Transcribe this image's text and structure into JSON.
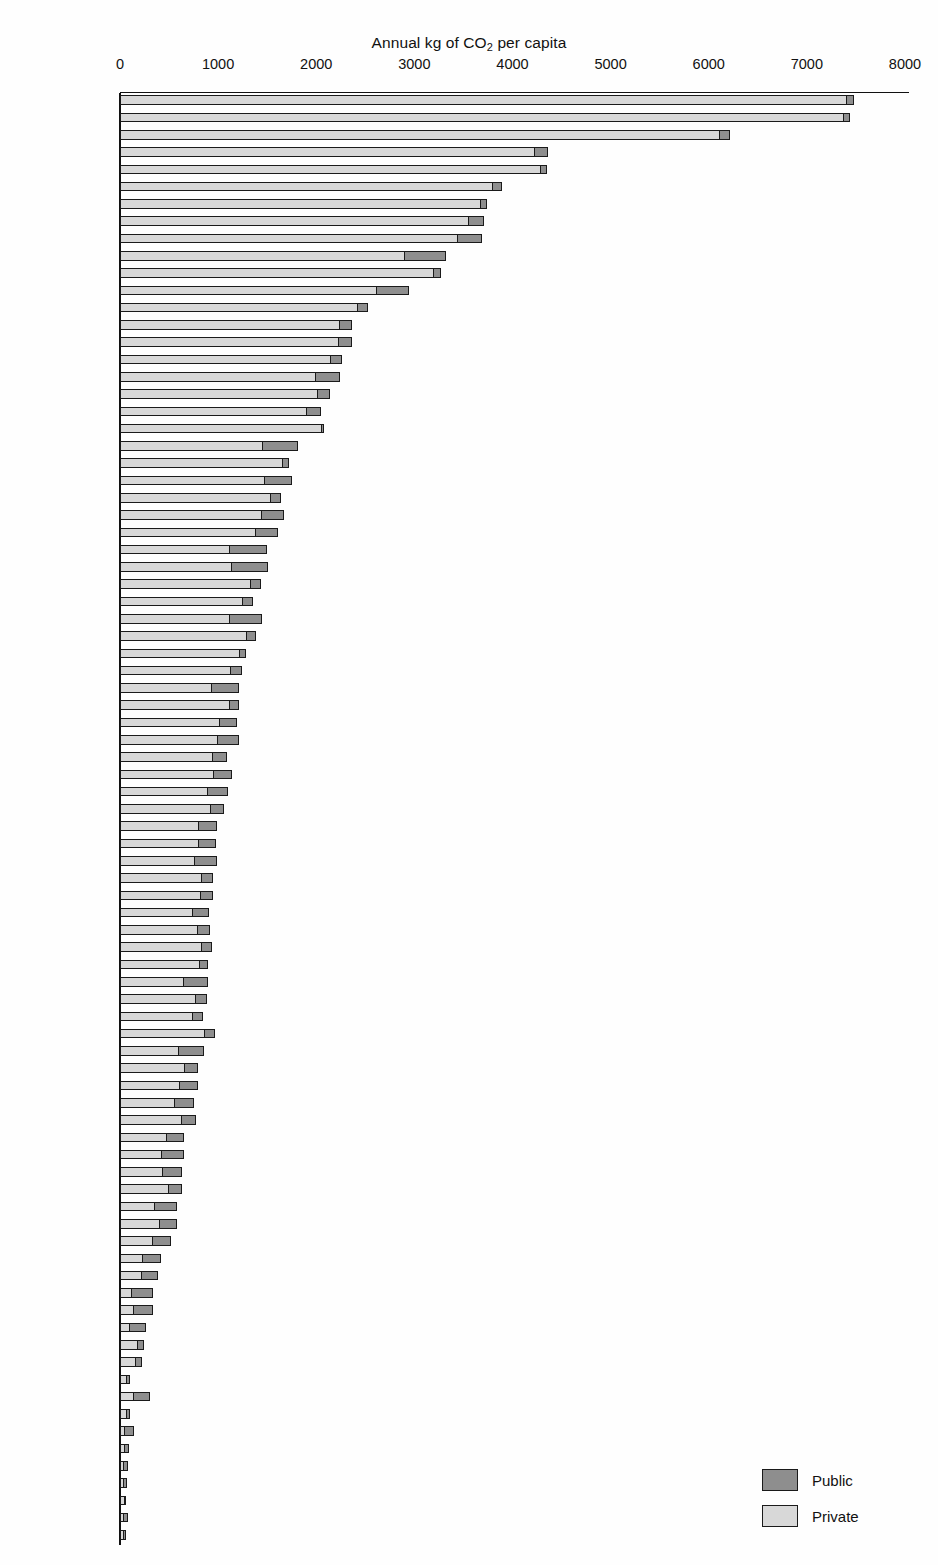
{
  "chart_data": {
    "type": "bar",
    "orientation": "horizontal",
    "stacked": true,
    "title": "Annual kg of CO2 per capita",
    "title_prefix": "Annual kg of CO",
    "title_subscript": "2",
    "title_suffix": " per capita",
    "xlabel": "",
    "ylabel": "",
    "xlim": [
      0,
      8000
    ],
    "xticks": [
      0,
      1000,
      2000,
      3000,
      4000,
      5000,
      6000,
      7000,
      8000
    ],
    "xtick_labels": [
      "0",
      "1000",
      "2000",
      "3000",
      "4000",
      "5000",
      "6000",
      "7000",
      "8000"
    ],
    "grid": false,
    "legend_position": "bottom-right",
    "legend": [
      {
        "name": "Public",
        "color": "#8e8e8e"
      },
      {
        "name": "Private",
        "color": "#d8d8d8"
      }
    ],
    "series": [
      {
        "name": "Private",
        "color": "#d8d8d8"
      },
      {
        "name": "Public",
        "color": "#8e8e8e"
      }
    ],
    "categories": [
      "Atlanta",
      "Houston",
      "San Francisco",
      "Denver",
      "San Diego",
      "Los Angeles",
      "Phoenix",
      "Washington",
      "Chicago",
      "New York",
      "Calgary",
      "Toronto",
      "Melbourne",
      "Perth",
      "Brisbane",
      "Vancouver",
      "Sydney",
      "Ottawa",
      "Montreal",
      "Riyadh",
      "Brussels",
      "Wellington",
      "Frankfurt",
      "Geneva",
      "Rome",
      "Hamburg",
      "Munich",
      "Stuttgart",
      "Oslo",
      "Stockholm",
      "Bangkok",
      "Nantes",
      "Marseille",
      "Ruhr",
      "Glasgow",
      "Lyon",
      "Zurich",
      "Vienna",
      "Dusseldorf",
      "Copenhagen",
      "London",
      "Newcastle",
      "Madrid",
      "Paris",
      "Berlin",
      "Graz",
      "Berne",
      "Milan",
      "Bologna",
      "Tel Aviv",
      "Amsterdam",
      "Johannesburg",
      "Athens",
      "Manchester",
      "Sapporo",
      "Tokyo",
      "Helsinki",
      "Singapore",
      "Osaka",
      "Kuala Lumpur",
      "Prague",
      "Sao Paulo",
      "Seoul",
      "Taipei",
      "Budapest",
      "Curitiba",
      "Barcelona",
      "Cape Town",
      "Harare",
      "Bogota",
      "Cracow",
      "Hong Kong",
      "Tehran",
      "Tunis",
      "Jakarta",
      "Manila",
      "Beijing",
      "Dakar",
      "Guangzhou",
      "Cairo",
      "Chennai",
      "Shanghai",
      "Mumbai",
      "Ho Chi Minh"
    ],
    "rows": [
      {
        "city": "Atlanta",
        "private": 7410,
        "public": 70,
        "total": 7480
      },
      {
        "city": "Houston",
        "private": 7380,
        "public": 60,
        "total": 7440
      },
      {
        "city": "San Francisco",
        "private": 6110,
        "public": 110,
        "total": 6220
      },
      {
        "city": "Denver",
        "private": 4230,
        "public": 130,
        "total": 4360
      },
      {
        "city": "San Diego",
        "private": 4290,
        "public": 60,
        "total": 4350
      },
      {
        "city": "Los Angeles",
        "private": 3800,
        "public": 90,
        "total": 3890
      },
      {
        "city": "Phoenix",
        "private": 3680,
        "public": 60,
        "total": 3740
      },
      {
        "city": "Washington",
        "private": 3560,
        "public": 150,
        "total": 3710
      },
      {
        "city": "Chicago",
        "private": 3440,
        "public": 250,
        "total": 3690
      },
      {
        "city": "New York",
        "private": 2900,
        "public": 420,
        "total": 3320
      },
      {
        "city": "Calgary",
        "private": 3200,
        "public": 70,
        "total": 3270
      },
      {
        "city": "Toronto",
        "private": 2620,
        "public": 330,
        "total": 2950
      },
      {
        "city": "Melbourne",
        "private": 2420,
        "public": 110,
        "total": 2530
      },
      {
        "city": "Perth",
        "private": 2240,
        "public": 120,
        "total": 2360
      },
      {
        "city": "Brisbane",
        "private": 2230,
        "public": 130,
        "total": 2360
      },
      {
        "city": "Vancouver",
        "private": 2150,
        "public": 110,
        "total": 2260
      },
      {
        "city": "Sydney",
        "private": 2000,
        "public": 240,
        "total": 2240
      },
      {
        "city": "Ottawa",
        "private": 2020,
        "public": 120,
        "total": 2140
      },
      {
        "city": "Montreal",
        "private": 1900,
        "public": 150,
        "total": 2050
      },
      {
        "city": "Riyadh",
        "private": 2060,
        "public": 20,
        "total": 2080
      },
      {
        "city": "Brussels",
        "private": 1450,
        "public": 360,
        "total": 1810
      },
      {
        "city": "Wellington",
        "private": 1660,
        "public": 60,
        "total": 1720
      },
      {
        "city": "Frankfurt",
        "private": 1470,
        "public": 280,
        "total": 1750
      },
      {
        "city": "Geneva",
        "private": 1540,
        "public": 100,
        "total": 1640
      },
      {
        "city": "Rome",
        "private": 1440,
        "public": 230,
        "total": 1670
      },
      {
        "city": "Hamburg",
        "private": 1380,
        "public": 230,
        "total": 1610
      },
      {
        "city": "Munich",
        "private": 1120,
        "public": 380,
        "total": 1500
      },
      {
        "city": "Stuttgart",
        "private": 1140,
        "public": 370,
        "total": 1510
      },
      {
        "city": "Oslo",
        "private": 1330,
        "public": 110,
        "total": 1440
      },
      {
        "city": "Stockholm",
        "private": 1250,
        "public": 110,
        "total": 1360
      },
      {
        "city": "Bangkok",
        "private": 1120,
        "public": 330,
        "total": 1450
      },
      {
        "city": "Nantes",
        "private": 1290,
        "public": 100,
        "total": 1390
      },
      {
        "city": "Marseille",
        "private": 1220,
        "public": 60,
        "total": 1280
      },
      {
        "city": "Ruhr",
        "private": 1130,
        "public": 110,
        "total": 1240
      },
      {
        "city": "Glasgow",
        "private": 930,
        "public": 280,
        "total": 1210
      },
      {
        "city": "Lyon",
        "private": 1120,
        "public": 90,
        "total": 1210
      },
      {
        "city": "Zurich",
        "private": 1020,
        "public": 170,
        "total": 1190
      },
      {
        "city": "Vienna",
        "private": 1000,
        "public": 210,
        "total": 1210
      },
      {
        "city": "Dusseldorf",
        "private": 940,
        "public": 150,
        "total": 1090
      },
      {
        "city": "Copenhagen",
        "private": 950,
        "public": 190,
        "total": 1140
      },
      {
        "city": "London",
        "private": 890,
        "public": 210,
        "total": 1100
      },
      {
        "city": "Newcastle",
        "private": 930,
        "public": 130,
        "total": 1060
      },
      {
        "city": "Madrid",
        "private": 800,
        "public": 190,
        "total": 990
      },
      {
        "city": "Paris",
        "private": 800,
        "public": 180,
        "total": 980
      },
      {
        "city": "Berlin",
        "private": 760,
        "public": 230,
        "total": 990
      },
      {
        "city": "Graz",
        "private": 830,
        "public": 120,
        "total": 950
      },
      {
        "city": "Berne",
        "private": 820,
        "public": 130,
        "total": 950
      },
      {
        "city": "Milan",
        "private": 740,
        "public": 170,
        "total": 910
      },
      {
        "city": "Bologna",
        "private": 790,
        "public": 130,
        "total": 920
      },
      {
        "city": "Tel Aviv",
        "private": 830,
        "public": 110,
        "total": 940
      },
      {
        "city": "Amsterdam",
        "private": 810,
        "public": 90,
        "total": 900
      },
      {
        "city": "Johannesburg",
        "private": 650,
        "public": 250,
        "total": 900
      },
      {
        "city": "Athens",
        "private": 770,
        "public": 120,
        "total": 890
      },
      {
        "city": "Manchester",
        "private": 740,
        "public": 110,
        "total": 850
      },
      {
        "city": "Sapporo",
        "private": 860,
        "public": 110,
        "total": 970
      },
      {
        "city": "Tokyo",
        "private": 600,
        "public": 260,
        "total": 860
      },
      {
        "city": "Helsinki",
        "private": 660,
        "public": 130,
        "total": 790
      },
      {
        "city": "Singapore",
        "private": 610,
        "public": 180,
        "total": 790
      },
      {
        "city": "Osaka",
        "private": 560,
        "public": 190,
        "total": 750
      },
      {
        "city": "Kuala Lumpur",
        "private": 630,
        "public": 140,
        "total": 770
      },
      {
        "city": "Prague",
        "private": 470,
        "public": 180,
        "total": 650
      },
      {
        "city": "Sao Paulo",
        "private": 420,
        "public": 230,
        "total": 650
      },
      {
        "city": "Seoul",
        "private": 430,
        "public": 200,
        "total": 630
      },
      {
        "city": "Taipei",
        "private": 500,
        "public": 130,
        "total": 630
      },
      {
        "city": "Budapest",
        "private": 350,
        "public": 230,
        "total": 580
      },
      {
        "city": "Curitiba",
        "private": 400,
        "public": 180,
        "total": 580
      },
      {
        "city": "Barcelona",
        "private": 330,
        "public": 190,
        "total": 520
      },
      {
        "city": "Cape Town",
        "private": 230,
        "public": 190,
        "total": 420
      },
      {
        "city": "Harare",
        "private": 220,
        "public": 170,
        "total": 390
      },
      {
        "city": "Bogota",
        "private": 110,
        "public": 230,
        "total": 340
      },
      {
        "city": "Cracow",
        "private": 130,
        "public": 210,
        "total": 340
      },
      {
        "city": "Hong Kong",
        "private": 90,
        "public": 180,
        "total": 270
      },
      {
        "city": "Tehran",
        "private": 180,
        "public": 60,
        "total": 240
      },
      {
        "city": "Tunis",
        "private": 160,
        "public": 60,
        "total": 220
      },
      {
        "city": "Jakarta",
        "private": 60,
        "public": 40,
        "total": 100
      },
      {
        "city": "Manila",
        "private": 130,
        "public": 180,
        "total": 310
      },
      {
        "city": "Beijing",
        "private": 60,
        "public": 40,
        "total": 100
      },
      {
        "city": "Dakar",
        "private": 30,
        "public": 110,
        "total": 140
      },
      {
        "city": "Guangzhou",
        "private": 40,
        "public": 50,
        "total": 90
      },
      {
        "city": "Cairo",
        "private": 30,
        "public": 50,
        "total": 80
      },
      {
        "city": "Chennai",
        "private": 30,
        "public": 40,
        "total": 70
      },
      {
        "city": "Shanghai",
        "private": 40,
        "public": 20,
        "total": 60
      },
      {
        "city": "Mumbai",
        "private": 30,
        "public": 50,
        "total": 80
      },
      {
        "city": "Ho Chi Minh",
        "private": 30,
        "public": 20,
        "total": 50
      }
    ]
  }
}
